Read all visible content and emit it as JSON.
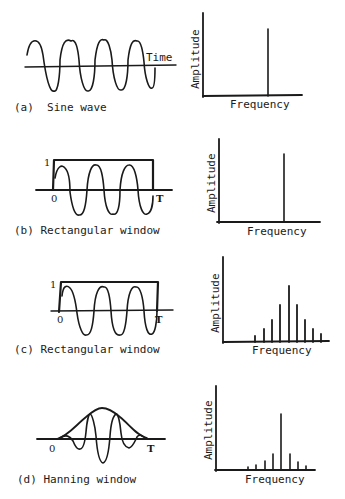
{
  "figure": {
    "panels": [
      {
        "id": "a",
        "caption": "(a)  Sine wave",
        "time_axis_label": "Time",
        "tick_start": "",
        "tick_end": "",
        "tick_one": "",
        "window": "none",
        "spectrum": {
          "ylabel": "Amplitude",
          "xlabel": "Frequency",
          "lines": [
            1.0
          ]
        }
      },
      {
        "id": "b",
        "caption": "(b) Rectangular window",
        "tick_start": "0",
        "tick_end": "T",
        "tick_one": "1",
        "window": "rectangular",
        "spectrum": {
          "ylabel": "Amplitude",
          "xlabel": "Frequency",
          "lines": [
            1.0
          ]
        }
      },
      {
        "id": "c",
        "caption": "(c) Rectangular window",
        "tick_start": "0",
        "tick_end": "T",
        "tick_one": "1",
        "window": "rectangular",
        "spectrum": {
          "ylabel": "Amplitude",
          "xlabel": "Frequency",
          "lines": [
            0.08,
            0.2,
            0.38,
            0.62,
            1.0,
            0.62,
            0.36,
            0.2,
            0.1
          ]
        }
      },
      {
        "id": "d",
        "caption": "(d) Hanning window",
        "tick_start": "0",
        "tick_end": "T",
        "tick_one": "",
        "window": "hanning",
        "spectrum": {
          "ylabel": "Amplitude",
          "xlabel": "Frequency",
          "lines": [
            0.05,
            0.08,
            0.17,
            0.3,
            1.0,
            0.3,
            0.15,
            0.08
          ]
        }
      }
    ]
  },
  "colors": {
    "ink": "#1a1a1a",
    "background": "#ffffff"
  }
}
